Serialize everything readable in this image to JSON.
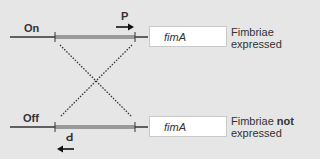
{
  "states": [
    {
      "label": "On",
      "promoter_label": "P",
      "gene": "fimA",
      "outcome_line1": "Fimbriae",
      "outcome_bold": "",
      "outcome_line2": "expressed"
    },
    {
      "label": "Off",
      "promoter_label": "P",
      "gene": "fimA",
      "outcome_line1": "Fimbriae ",
      "outcome_bold": "not",
      "outcome_line2": "expressed"
    }
  ],
  "colors": {
    "background": "#e6e6e6",
    "invertible_segment": "#9a9a9a",
    "line": "#333333"
  }
}
